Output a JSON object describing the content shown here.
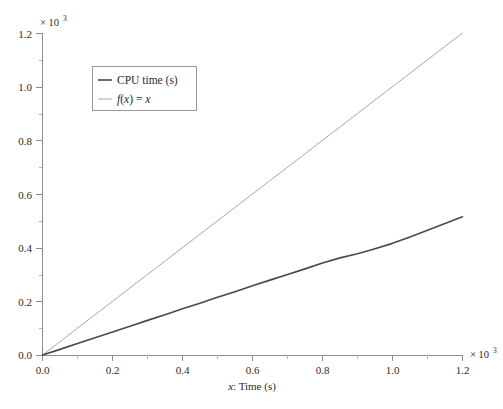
{
  "chart_data": {
    "type": "line",
    "title": "",
    "xlabel": "x: Time (s)",
    "ylabel": "",
    "x_multiplier": "× 10",
    "x_multiplier_exponent": "3",
    "y_multiplier": "× 10",
    "y_multiplier_exponent": "3",
    "xlim": [
      0.0,
      1.2
    ],
    "ylim": [
      0.0,
      1.2
    ],
    "x_ticks": [
      "0.0",
      "0.2",
      "0.4",
      "0.6",
      "0.8",
      "1.0",
      "1.2"
    ],
    "x_tick_values": [
      0.0,
      0.2,
      0.4,
      0.6,
      0.8,
      1.0,
      1.2
    ],
    "x_minor_tick_values": [
      0.1,
      0.3,
      0.5,
      0.7,
      0.9,
      1.1
    ],
    "y_ticks": [
      "0.0",
      "0.2",
      "0.4",
      "0.6",
      "0.8",
      "1.0",
      "1.2"
    ],
    "y_tick_values": [
      0.0,
      0.2,
      0.4,
      0.6,
      0.8,
      1.0,
      1.2
    ],
    "y_minor_tick_values": [
      0.1,
      0.3,
      0.5,
      0.7,
      0.9,
      1.1
    ],
    "grid": false,
    "legend_position": "upper-left-inset",
    "series": [
      {
        "name": "CPU time (s)",
        "color": "#4a4a4a",
        "width": 1.6,
        "x": [
          0.0,
          0.05,
          0.1,
          0.15,
          0.2,
          0.25,
          0.3,
          0.35,
          0.4,
          0.45,
          0.5,
          0.55,
          0.6,
          0.65,
          0.7,
          0.75,
          0.8,
          0.85,
          0.9,
          0.95,
          1.0,
          1.05,
          1.1,
          1.15,
          1.2
        ],
        "values": [
          0.0,
          0.021,
          0.043,
          0.064,
          0.086,
          0.107,
          0.129,
          0.15,
          0.172,
          0.193,
          0.215,
          0.236,
          0.258,
          0.279,
          0.3,
          0.321,
          0.343,
          0.362,
          0.377,
          0.396,
          0.416,
          0.44,
          0.465,
          0.49,
          0.515
        ]
      },
      {
        "name": "f(x) = x",
        "color": "#a8a8a8",
        "width": 1.0,
        "x": [
          0.0,
          1.2
        ],
        "values": [
          0.0,
          1.2
        ]
      }
    ],
    "legend_entries": [
      {
        "label": "CPU time (s)",
        "italic_prefix": "",
        "color": "#4a4a4a"
      },
      {
        "label": "f(x) = x",
        "italic_prefix": "f",
        "color": "#a8a8a8"
      }
    ]
  },
  "legend": {
    "entry_1_label": "CPU time (s)",
    "entry_2_f": "f",
    "entry_2_paren_open": "(",
    "entry_2_x1": "x",
    "entry_2_paren_close": ")",
    "entry_2_eq": " = ",
    "entry_2_x2": "x"
  },
  "axis": {
    "x_title_var": "x",
    "x_title_rest": ": Time (s)"
  }
}
